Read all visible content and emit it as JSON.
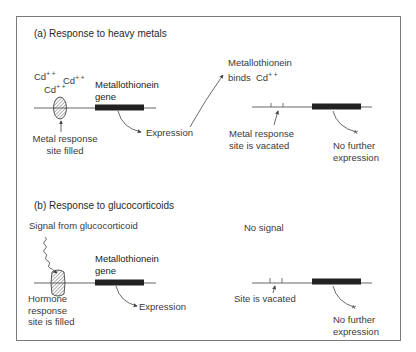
{
  "panel_a": {
    "title": "(a) Response to heavy metals",
    "ions": [
      "Cd",
      "Cd",
      "Cd"
    ],
    "ion_charge": "+ +",
    "gene_label_line1": "Metallothionein",
    "gene_label_line2": "gene",
    "site_label_line1": "Metal response",
    "site_label_line2": "site filled",
    "expression_label": "Expression",
    "binds_label_line1": "Metallothionein",
    "binds_label_line2": "binds",
    "binds_ion": "Cd",
    "vacated_label_line1": "Metal response",
    "vacated_label_line2": "site is vacated",
    "no_expression_line1": "No further",
    "no_expression_line2": "expression"
  },
  "panel_b": {
    "title": "(b) Response to glucocorticoids",
    "signal_label": "Signal from glucocorticoid",
    "gene_label_line1": "Metallothionein",
    "gene_label_line2": "gene",
    "site_label_line1": "Hormone",
    "site_label_line2": "response",
    "site_label_line3": "site is filled",
    "expression_label": "Expression",
    "no_signal_label": "No signal",
    "vacated_label": "Site is vacated",
    "no_expression_line1": "No further",
    "no_expression_line2": "expression"
  },
  "colors": {
    "frame": "#7a7a7a",
    "dna_line": "#555555",
    "gene_bar": "#222222",
    "text": "#3a3a3a"
  }
}
